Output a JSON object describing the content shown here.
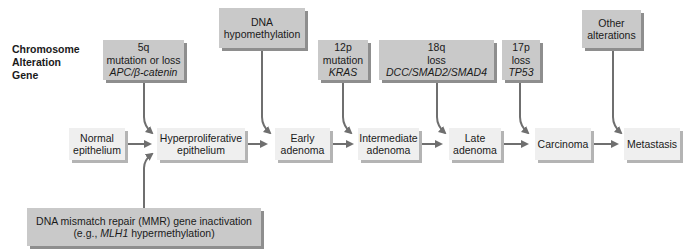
{
  "legend": {
    "line1": "Chromosome",
    "line2": "Alteration",
    "line3": "Gene"
  },
  "alterations": [
    {
      "chromosome": "5q",
      "alteration": "mutation or loss",
      "gene": "APC/β-catenin"
    },
    {
      "line1": "DNA",
      "line2": "hypomethylation"
    },
    {
      "chromosome": "12p",
      "alteration": "mutation",
      "gene": "KRAS"
    },
    {
      "chromosome": "18q",
      "alteration": "loss",
      "gene": "DCC/SMAD2/SMAD4"
    },
    {
      "chromosome": "17p",
      "alteration": "loss",
      "gene": "TP53"
    },
    {
      "line1": "Other",
      "line2": "alterations"
    }
  ],
  "stages": [
    {
      "line1": "Normal",
      "line2": "epithelium"
    },
    {
      "line1": "Hyperproliferative",
      "line2": "epithelium"
    },
    {
      "line1": "Early",
      "line2": "adenoma"
    },
    {
      "line1": "Intermediate",
      "line2": "adenoma"
    },
    {
      "line1": "Late",
      "line2": "adenoma"
    },
    {
      "line1": "Carcinoma",
      "line2": ""
    },
    {
      "line1": "Metastasis",
      "line2": ""
    }
  ],
  "mmr": {
    "line1": "DNA mismatch repair (MMR) gene inactivation",
    "line2_prefix": "(e.g., ",
    "line2_gene": "MLH1",
    "line2_suffix": " hypermethylation)"
  },
  "colors": {
    "alteration_box": "#c9c9c9",
    "stage_box": "#efefef",
    "arrow": "#6f6f6f"
  }
}
